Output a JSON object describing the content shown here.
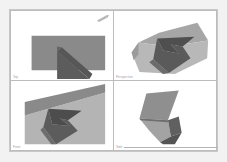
{
  "window": {
    "title": "Quad Viewport 3D Model"
  },
  "palette": {
    "viewport_background": "#ffffff",
    "splitter": "#bcbcbc",
    "window_border": "#c8c8c8",
    "page_background": "#f2f2f2",
    "face_light": "#b2b2b2",
    "face_mid": "#8a8a8a",
    "face_dark": "#606060",
    "face_darkest": "#4e4e4e",
    "label_text": "#9a9a9a"
  },
  "viewports": [
    {
      "id": "viewport-top-left",
      "label": "Top",
      "projection": "orthographic",
      "has_gizmo": true,
      "gizmo_name": "view-axis-gizmo"
    },
    {
      "id": "viewport-top-right",
      "label": "Perspective",
      "projection": "perspective",
      "has_gizmo": false,
      "gizmo_name": ""
    },
    {
      "id": "viewport-bottom-left",
      "label": "Front",
      "projection": "orthographic",
      "has_gizmo": false,
      "gizmo_name": ""
    },
    {
      "id": "viewport-bottom-right",
      "label": "Side",
      "projection": "orthographic",
      "has_gizmo": false,
      "gizmo_name": ""
    }
  ],
  "status": {
    "text": ""
  }
}
